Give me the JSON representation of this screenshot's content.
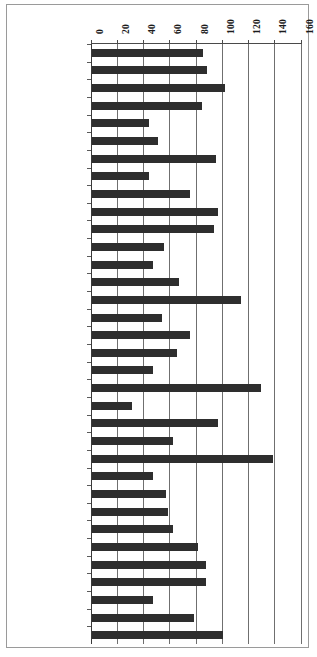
{
  "chart_data": {
    "type": "bar",
    "orientation": "horizontal",
    "title": "",
    "subtitle": "",
    "xlabel": "",
    "ylabel": "",
    "xlim": [
      0,
      160
    ],
    "xticks": [
      0,
      20,
      40,
      60,
      80,
      100,
      120,
      140,
      160
    ],
    "xtick_labels": [
      "0",
      "20",
      "40",
      "60",
      "80",
      "100",
      "120",
      "140",
      "160"
    ],
    "grid": true,
    "grid_axis": "x",
    "legend": null,
    "legend_position": "none",
    "bar_color": "#2e2e2e",
    "categories": [
      "Australia",
      "Austria",
      "Belgium",
      "Canada",
      "Chile",
      "Czech Republic",
      "Denmark",
      "Estonia",
      "Finland",
      "France",
      "Germany",
      "Greece",
      "Hungary",
      "Iceland",
      "Ireland",
      "Israel",
      "Italy",
      "Japan",
      "Korea",
      "Luxembourg",
      "Mexico",
      "Netherlands",
      "New Zealand",
      "Norway",
      "Poland",
      "Portugal",
      "Slovak Republic",
      "Slovenia",
      "Spain",
      "Sweden",
      "Switzerland",
      "Turkey",
      "United Kingdom",
      "United States"
    ],
    "values": [
      85,
      88,
      102,
      84,
      44,
      51,
      95,
      44,
      75,
      96,
      93,
      55,
      47,
      67,
      114,
      54,
      75,
      65,
      47,
      129,
      31,
      96,
      62,
      138,
      47,
      57,
      58,
      62,
      81,
      87,
      87,
      47,
      78,
      100
    ]
  }
}
